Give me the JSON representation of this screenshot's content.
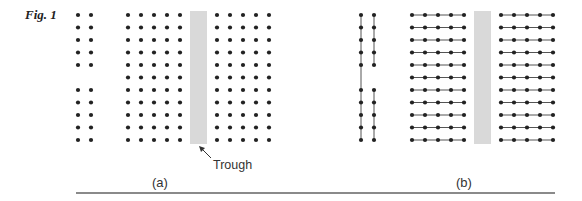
{
  "figure": {
    "label": "Fig. 1",
    "panels": [
      {
        "id": "a",
        "caption": "(a)",
        "connected": false
      },
      {
        "id": "b",
        "caption": "(b)",
        "connected": true
      }
    ],
    "annotation": "Trough",
    "colors": {
      "dot": "#222222",
      "line": "#555555",
      "trough": "#d9d9d9",
      "rule": "#8a8a8a"
    },
    "rows": 11,
    "left_pair_missing_row": 5
  }
}
